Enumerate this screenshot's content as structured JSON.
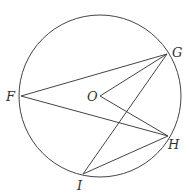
{
  "diagram": {
    "stroke_color": "#444444",
    "label_color": "#333333",
    "circle": {
      "center_label": "O",
      "cx": 100,
      "cy": 96,
      "r": 81
    },
    "points": [
      {
        "id": "F",
        "label": "F",
        "x": 21,
        "y": 96,
        "label_x": 6,
        "label_y": 101
      },
      {
        "id": "G",
        "label": "G",
        "x": 167,
        "y": 54,
        "label_x": 172,
        "label_y": 57
      },
      {
        "id": "O",
        "label": "O",
        "x": 100,
        "y": 96,
        "label_x": 87,
        "label_y": 101
      },
      {
        "id": "H",
        "label": "H",
        "x": 168,
        "y": 136,
        "label_x": 168,
        "label_y": 149
      },
      {
        "id": "I",
        "label": "I",
        "x": 83,
        "y": 174,
        "label_x": 77,
        "label_y": 190
      }
    ],
    "segments": [
      {
        "name": "FG",
        "from": "F",
        "to": "G"
      },
      {
        "name": "FH",
        "from": "F",
        "to": "H"
      },
      {
        "name": "OG",
        "from": "O",
        "to": "G"
      },
      {
        "name": "OH",
        "from": "O",
        "to": "H"
      },
      {
        "name": "IG",
        "from": "I",
        "to": "G"
      },
      {
        "name": "IH",
        "from": "I",
        "to": "H"
      }
    ]
  }
}
